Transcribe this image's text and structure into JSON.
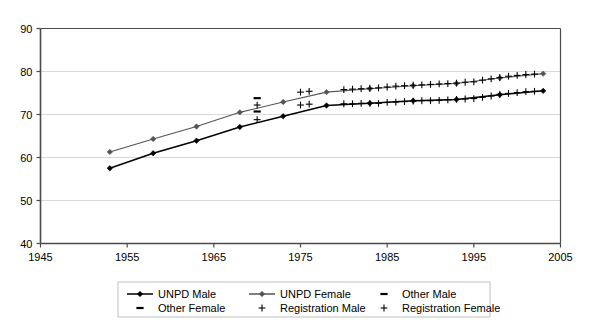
{
  "chart_data": {
    "type": "line",
    "title": "",
    "xlabel": "",
    "ylabel": "",
    "xlim": [
      1945,
      2005
    ],
    "ylim": [
      40,
      90
    ],
    "xticks": [
      1945,
      1955,
      1965,
      1975,
      1985,
      1995,
      2005
    ],
    "yticks": [
      40,
      50,
      60,
      70,
      80,
      90
    ],
    "grid": "horizontal",
    "legend_position": "bottom",
    "series": [
      {
        "name": "UNPD Male",
        "marker": "diamond",
        "color": "#000000",
        "line": "solid",
        "x": [
          1953,
          1958,
          1963,
          1968,
          1973,
          1978,
          1983,
          1988,
          1993,
          1998,
          2003
        ],
        "y": [
          57.5,
          61.0,
          63.9,
          67.1,
          69.6,
          72.1,
          72.6,
          73.2,
          73.5,
          74.6,
          75.5
        ]
      },
      {
        "name": "UNPD Female",
        "marker": "diamond",
        "color": "#555555",
        "line": "solid",
        "x": [
          1953,
          1958,
          1963,
          1968,
          1973,
          1978,
          1983,
          1988,
          1993,
          1998,
          2003
        ],
        "y": [
          61.3,
          64.3,
          67.2,
          70.5,
          72.9,
          75.2,
          76.0,
          76.7,
          77.2,
          78.5,
          79.5
        ]
      },
      {
        "name": "Other Male",
        "marker": "dash",
        "color": "#000000",
        "line": "none",
        "x": [
          1970
        ],
        "y": [
          70.7
        ]
      },
      {
        "name": "Other Female",
        "marker": "dash",
        "color": "#000000",
        "line": "none",
        "x": [
          1970
        ],
        "y": [
          73.8
        ]
      },
      {
        "name": "Registration Male",
        "marker": "plus",
        "color": "#000000",
        "line": "none",
        "x": [
          1970,
          1975,
          1976,
          1980,
          1981,
          1982,
          1983,
          1984,
          1985,
          1986,
          1987,
          1988,
          1989,
          1990,
          1991,
          1992,
          1993,
          1994,
          1995,
          1996,
          1997,
          1998,
          1999,
          2000,
          2001,
          2002
        ],
        "y": [
          68.8,
          72.2,
          72.4,
          72.5,
          72.5,
          72.6,
          72.6,
          72.6,
          72.8,
          72.9,
          73.0,
          73.1,
          73.2,
          73.2,
          73.3,
          73.4,
          73.5,
          73.6,
          73.7,
          74.0,
          74.3,
          74.7,
          74.9,
          75.1,
          75.3,
          75.4
        ]
      },
      {
        "name": "Registration Female",
        "marker": "plus",
        "color": "#000000",
        "line": "none",
        "x": [
          1970,
          1975,
          1976,
          1980,
          1981,
          1982,
          1983,
          1984,
          1985,
          1986,
          1987,
          1988,
          1989,
          1990,
          1991,
          1992,
          1993,
          1994,
          1995,
          1996,
          1997,
          1998,
          1999,
          2000,
          2001,
          2002
        ],
        "y": [
          72.2,
          75.2,
          75.4,
          75.8,
          75.9,
          76.0,
          76.1,
          76.2,
          76.4,
          76.6,
          76.7,
          76.8,
          76.9,
          77.0,
          77.1,
          77.2,
          77.3,
          77.5,
          77.6,
          78.0,
          78.3,
          78.6,
          78.9,
          79.1,
          79.3,
          79.4
        ]
      }
    ]
  },
  "axes": {
    "y_tick_labels": [
      "90",
      "80",
      "70",
      "60",
      "50",
      "40"
    ],
    "x_tick_labels": [
      "1945",
      "1955",
      "1965",
      "1975",
      "1985",
      "1995",
      "2005"
    ]
  },
  "legend": {
    "entries": [
      {
        "label": "UNPD Male",
        "marker": "line-diamond",
        "color": "#000000"
      },
      {
        "label": "UNPD Female",
        "marker": "line-diamond",
        "color": "#555555"
      },
      {
        "label": "Other Male",
        "marker": "dash",
        "color": "#000000"
      },
      {
        "label": "Other Female",
        "marker": "dash",
        "color": "#000000"
      },
      {
        "label": "Registration Male",
        "marker": "plus",
        "color": "#000000"
      },
      {
        "label": "Registration Female",
        "marker": "plus",
        "color": "#000000"
      }
    ]
  },
  "style": {
    "axis_color": "#4a4a4a",
    "grid_color": "#d8d8d8",
    "legend_border": "#bfbfbf",
    "background": "#ffffff"
  }
}
